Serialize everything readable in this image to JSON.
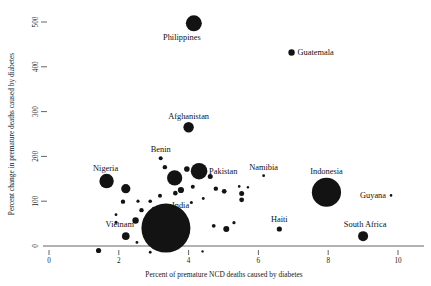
{
  "chart_data": {
    "type": "scatter",
    "title": "",
    "xlabel": "Percent of premature NCD deaths caused by diabetes",
    "ylabel": "Percent change in premature deaths caused by diabetes",
    "xlim": [
      0,
      10.6
    ],
    "ylim": [
      -40,
      520
    ],
    "xticks": [
      0,
      2,
      4,
      6,
      8,
      10
    ],
    "xticklabels": [
      "0",
      "2",
      "4",
      "6",
      "8",
      "10"
    ],
    "yticks": [
      0,
      100,
      200,
      300,
      400,
      500
    ],
    "yticklabels": [
      "0",
      "100",
      "200",
      "300",
      "400",
      "500"
    ],
    "grid": false,
    "legend": false,
    "marker_color": "#131313",
    "size_encodes": "population",
    "points": [
      {
        "name": "Philippines",
        "x": 4.15,
        "y": 497,
        "r": 8.0,
        "label": "Philippines",
        "label_dx": -12,
        "label_dy": 17,
        "label_anchor": "middle"
      },
      {
        "name": "Guatemala",
        "x": 6.95,
        "y": 432,
        "r": 3.2,
        "label": "Guatemala",
        "label_dx": 6,
        "label_dy": 3,
        "label_anchor": "start"
      },
      {
        "name": "Afghanistan",
        "x": 4.0,
        "y": 265,
        "r": 5.2,
        "label": "Afghanistan",
        "label_dx": 0,
        "label_dy": -8,
        "label_anchor": "middle"
      },
      {
        "name": "Benin",
        "x": 3.2,
        "y": 196,
        "r": 2.0,
        "label": "Benin",
        "label_dx": 0,
        "label_dy": -6,
        "label_anchor": "middle"
      },
      {
        "name": "Pakistan",
        "x": 4.3,
        "y": 167,
        "r": 8.3,
        "label": "Pakistan",
        "label_dx": 10,
        "label_dy": 3,
        "label_anchor": "start"
      },
      {
        "name": "Nigeria",
        "x": 1.65,
        "y": 145,
        "r": 7.2,
        "label": "Nigeria",
        "label_dx": -1,
        "label_dy": -10,
        "label_anchor": "middle"
      },
      {
        "name": "Namibia",
        "x": 6.15,
        "y": 157,
        "r": 1.4,
        "label": "Namibia",
        "label_dx": 0,
        "label_dy": -6,
        "label_anchor": "middle"
      },
      {
        "name": "Indonesia",
        "x": 7.95,
        "y": 120,
        "r": 14.6,
        "label": "Indonesia",
        "label_dx": 0,
        "label_dy": -18,
        "label_anchor": "middle"
      },
      {
        "name": "Guyana",
        "x": 9.8,
        "y": 113,
        "r": 1.3,
        "label": "Guyana",
        "label_dx": -5,
        "label_dy": 3,
        "label_anchor": "end"
      },
      {
        "name": "India",
        "x": 3.35,
        "y": 40,
        "r": 24.5,
        "label": "India",
        "label_dx": 6,
        "label_dy": -20,
        "label_anchor": "start"
      },
      {
        "name": "Vietnam",
        "x": 2.2,
        "y": 22,
        "r": 3.8,
        "label": "Vietnam",
        "label_dx": -6,
        "label_dy": -9,
        "label_anchor": "middle"
      },
      {
        "name": "Haiti",
        "x": 6.6,
        "y": 38,
        "r": 2.6,
        "label": "Haiti",
        "label_dx": 0,
        "label_dy": -7,
        "label_anchor": "middle"
      },
      {
        "name": "South Africa",
        "x": 9.0,
        "y": 22,
        "r": 5.0,
        "label": "South Africa",
        "label_dx": 2,
        "label_dy": -9,
        "label_anchor": "middle"
      },
      {
        "name": "unlabeled-01",
        "x": 3.6,
        "y": 152,
        "r": 7.6,
        "label": "",
        "label_dx": 0,
        "label_dy": 0,
        "label_anchor": "middle"
      },
      {
        "name": "unlabeled-02",
        "x": 2.2,
        "y": 128,
        "r": 4.6,
        "label": "",
        "label_dx": 0,
        "label_dy": 0,
        "label_anchor": "middle"
      },
      {
        "name": "unlabeled-03",
        "x": 3.32,
        "y": 176,
        "r": 2.2,
        "label": "",
        "label_dx": 0,
        "label_dy": 0,
        "label_anchor": "middle"
      },
      {
        "name": "unlabeled-04",
        "x": 3.95,
        "y": 172,
        "r": 2.8,
        "label": "",
        "label_dx": 0,
        "label_dy": 0,
        "label_anchor": "middle"
      },
      {
        "name": "unlabeled-05",
        "x": 4.62,
        "y": 155,
        "r": 2.5,
        "label": "",
        "label_dx": 0,
        "label_dy": 0,
        "label_anchor": "middle"
      },
      {
        "name": "unlabeled-06",
        "x": 4.78,
        "y": 128,
        "r": 2.2,
        "label": "",
        "label_dx": 0,
        "label_dy": 0,
        "label_anchor": "middle"
      },
      {
        "name": "unlabeled-07",
        "x": 4.12,
        "y": 132,
        "r": 2.0,
        "label": "",
        "label_dx": 0,
        "label_dy": 0,
        "label_anchor": "middle"
      },
      {
        "name": "unlabeled-08",
        "x": 3.78,
        "y": 125,
        "r": 3.1,
        "label": "",
        "label_dx": 0,
        "label_dy": 0,
        "label_anchor": "middle"
      },
      {
        "name": "unlabeled-09",
        "x": 3.62,
        "y": 118,
        "r": 2.3,
        "label": "",
        "label_dx": 0,
        "label_dy": 0,
        "label_anchor": "middle"
      },
      {
        "name": "unlabeled-10",
        "x": 3.18,
        "y": 112,
        "r": 2.0,
        "label": "",
        "label_dx": 0,
        "label_dy": 0,
        "label_anchor": "middle"
      },
      {
        "name": "unlabeled-11",
        "x": 2.9,
        "y": 100,
        "r": 1.8,
        "label": "",
        "label_dx": 0,
        "label_dy": 0,
        "label_anchor": "middle"
      },
      {
        "name": "unlabeled-12",
        "x": 2.55,
        "y": 100,
        "r": 1.6,
        "label": "",
        "label_dx": 0,
        "label_dy": 0,
        "label_anchor": "middle"
      },
      {
        "name": "unlabeled-13",
        "x": 2.12,
        "y": 99,
        "r": 2.2,
        "label": "",
        "label_dx": 0,
        "label_dy": 0,
        "label_anchor": "middle"
      },
      {
        "name": "unlabeled-14",
        "x": 2.65,
        "y": 80,
        "r": 2.2,
        "label": "",
        "label_dx": 0,
        "label_dy": 0,
        "label_anchor": "middle"
      },
      {
        "name": "unlabeled-15",
        "x": 3.0,
        "y": 84,
        "r": 1.7,
        "label": "",
        "label_dx": 0,
        "label_dy": 0,
        "label_anchor": "middle"
      },
      {
        "name": "unlabeled-16",
        "x": 2.48,
        "y": 57,
        "r": 3.2,
        "label": "",
        "label_dx": 0,
        "label_dy": 0,
        "label_anchor": "middle"
      },
      {
        "name": "unlabeled-17",
        "x": 1.92,
        "y": 53,
        "r": 1.5,
        "label": "",
        "label_dx": 0,
        "label_dy": 0,
        "label_anchor": "middle"
      },
      {
        "name": "unlabeled-18",
        "x": 4.72,
        "y": 45,
        "r": 1.9,
        "label": "",
        "label_dx": 0,
        "label_dy": 0,
        "label_anchor": "middle"
      },
      {
        "name": "unlabeled-19",
        "x": 5.3,
        "y": 52,
        "r": 1.6,
        "label": "",
        "label_dx": 0,
        "label_dy": 0,
        "label_anchor": "middle"
      },
      {
        "name": "unlabeled-20",
        "x": 5.08,
        "y": 38,
        "r": 3.0,
        "label": "",
        "label_dx": 0,
        "label_dy": 0,
        "label_anchor": "middle"
      },
      {
        "name": "unlabeled-21",
        "x": 5.02,
        "y": 122,
        "r": 2.4,
        "label": "",
        "label_dx": 0,
        "label_dy": 0,
        "label_anchor": "middle"
      },
      {
        "name": "unlabeled-22",
        "x": 5.45,
        "y": 133,
        "r": 1.3,
        "label": "",
        "label_dx": 0,
        "label_dy": 0,
        "label_anchor": "middle"
      },
      {
        "name": "unlabeled-23",
        "x": 5.52,
        "y": 117,
        "r": 2.5,
        "label": "",
        "label_dx": 0,
        "label_dy": 0,
        "label_anchor": "middle"
      },
      {
        "name": "unlabeled-24",
        "x": 5.52,
        "y": 103,
        "r": 2.4,
        "label": "",
        "label_dx": 0,
        "label_dy": 0,
        "label_anchor": "middle"
      },
      {
        "name": "unlabeled-25",
        "x": 5.7,
        "y": 131,
        "r": 1.2,
        "label": "",
        "label_dx": 0,
        "label_dy": 0,
        "label_anchor": "middle"
      },
      {
        "name": "unlabeled-26",
        "x": 2.52,
        "y": 8,
        "r": 1.4,
        "label": "",
        "label_dx": 0,
        "label_dy": 0,
        "label_anchor": "middle"
      },
      {
        "name": "unlabeled-27",
        "x": 1.42,
        "y": -10,
        "r": 2.6,
        "label": "",
        "label_dx": 0,
        "label_dy": 0,
        "label_anchor": "middle"
      },
      {
        "name": "unlabeled-28",
        "x": 2.9,
        "y": -14,
        "r": 1.4,
        "label": "",
        "label_dx": 0,
        "label_dy": 0,
        "label_anchor": "middle"
      },
      {
        "name": "unlabeled-29",
        "x": 4.4,
        "y": -12,
        "r": 1.2,
        "label": "",
        "label_dx": 0,
        "label_dy": 0,
        "label_anchor": "middle"
      },
      {
        "name": "unlabeled-30",
        "x": 4.08,
        "y": 97,
        "r": 1.5,
        "label": "",
        "label_dx": 0,
        "label_dy": 0,
        "label_anchor": "middle"
      },
      {
        "name": "unlabeled-31",
        "x": 4.42,
        "y": 106,
        "r": 1.4,
        "label": "",
        "label_dx": 0,
        "label_dy": 0,
        "label_anchor": "middle"
      },
      {
        "name": "unlabeled-32",
        "x": 1.92,
        "y": 70,
        "r": 1.4,
        "label": "",
        "label_dx": 0,
        "label_dy": 0,
        "label_anchor": "middle"
      }
    ]
  }
}
